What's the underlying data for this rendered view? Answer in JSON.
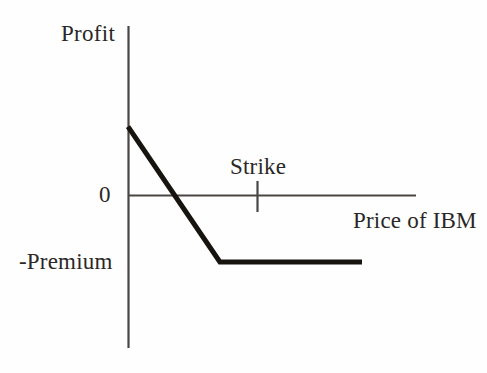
{
  "figure": {
    "background_color": "#fefefe",
    "ink_color": "#2b2726",
    "axis_color": "#4a4643",
    "payoff_color": "#17140f"
  },
  "labels": {
    "y_axis_title": "Profit",
    "y_zero_tick": "0",
    "y_premium_tick": "-Premium",
    "strike_marker": "Strike",
    "x_axis_title": "Price of IBM"
  },
  "chart_data": {
    "type": "line",
    "title": "",
    "subtitle": "",
    "xlabel": "Price of IBM",
    "ylabel": "Profit",
    "grid": false,
    "legend": false,
    "legend_position": "none",
    "xlim": [
      0,
      10
    ],
    "ylim": [
      -3.2,
      3.2
    ],
    "x_tick_labels": [
      "Strike"
    ],
    "x_tick_values": [
      4.5
    ],
    "y_tick_labels": [
      "0",
      "-Premium"
    ],
    "y_tick_values": [
      0,
      -1.4
    ],
    "annotations": [
      {
        "text": "Strike",
        "x": 4.5,
        "y": 0.75,
        "kind": "axis-marker-label"
      },
      {
        "text": "Profit",
        "x": 0,
        "y": 3.1,
        "kind": "axis-title"
      },
      {
        "text": "Price of IBM",
        "x": 9.1,
        "y": -0.3,
        "kind": "axis-title"
      },
      {
        "text": "0",
        "x": -0.35,
        "y": 0,
        "kind": "tick-label"
      },
      {
        "text": "-Premium",
        "x": -1.6,
        "y": -1.4,
        "kind": "tick-label"
      }
    ],
    "series": [
      {
        "name": "Short call payoff",
        "x": [
          0,
          3.3,
          8.4
        ],
        "values": [
          1.45,
          -1.4,
          -1.4
        ],
        "line_width": 5,
        "color": "#17140f"
      }
    ]
  }
}
